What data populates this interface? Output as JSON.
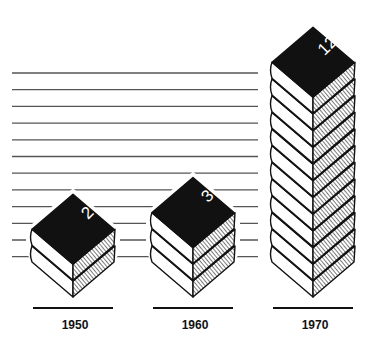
{
  "chart_data": {
    "type": "pictograph",
    "title": "",
    "categories": [
      "1950",
      "1960",
      "1970"
    ],
    "values": [
      2,
      3,
      12
    ],
    "unit_icon": "book",
    "value_labels": [
      "2",
      "3",
      "12"
    ],
    "xlabel": "",
    "ylabel": "",
    "grid": true,
    "grid_lines": 12,
    "legend": null
  },
  "colors": {
    "ink": "#111111",
    "background": "#ffffff",
    "rule": "#555555"
  },
  "labels": {
    "years": [
      "1950",
      "1960",
      "1970"
    ]
  }
}
